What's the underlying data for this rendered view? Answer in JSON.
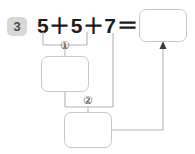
{
  "problem": {
    "number": "3",
    "equation": {
      "full": "5＋5＋7＝",
      "operand_1": "5",
      "operator_1": "＋",
      "operand_2": "5",
      "operator_2": "＋",
      "operand_3": "7",
      "equals": "＝"
    }
  },
  "markers": {
    "step_1": "①",
    "step_2": "②"
  },
  "boxes": {
    "result": {
      "value": "",
      "placeholder": ""
    },
    "step_1": {
      "value": "",
      "placeholder": ""
    },
    "step_2": {
      "value": "",
      "placeholder": ""
    }
  },
  "colors": {
    "badge_bg": "#d8d8d8",
    "badge_text": "#4a4a4a",
    "equation_text": "#1c1c1c",
    "box_border": "#c9c9c9",
    "line": "#b4b4b4",
    "arrow": "#3a3a3a",
    "page_bg": "#ffffff"
  }
}
